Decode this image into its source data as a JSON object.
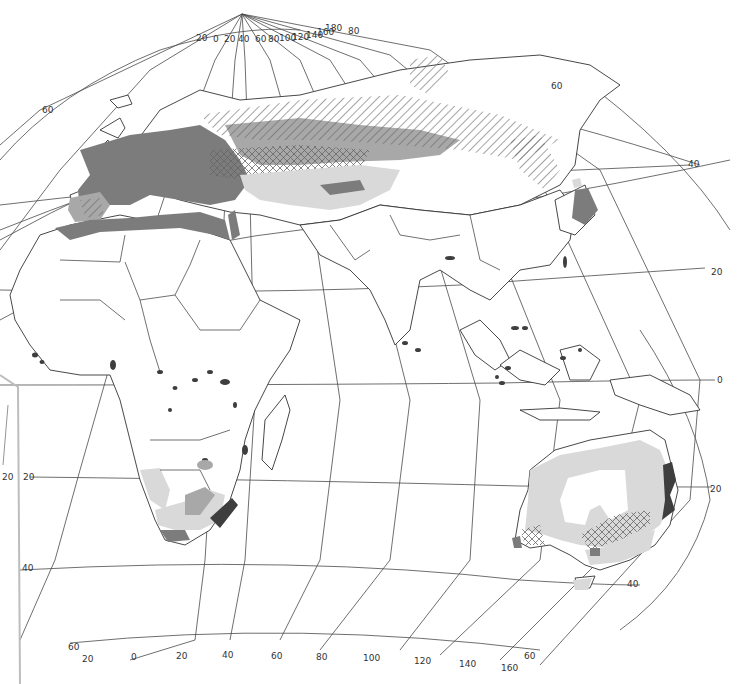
{
  "map": {
    "projection": "oblique",
    "region": "Eastern Hemisphere (Europe, Africa, Asia, Australia)",
    "meridian_labels_top": [
      "20",
      "0",
      "20",
      "40",
      "60",
      "80",
      "100",
      "120",
      "140",
      "160",
      "180"
    ],
    "top_right_parallel_label": "80",
    "meridian_labels_bottom": [
      "20",
      "0",
      "20",
      "40",
      "60",
      "80",
      "100",
      "120",
      "140",
      "160"
    ],
    "parallel_labels": {
      "left_60": "60",
      "right_60_north": "60",
      "right_40": "40",
      "right_20": "20",
      "right_0": "0",
      "right_20_south": "20",
      "left_20_south_a": "20",
      "left_20_south_b": "20",
      "left_40_south": "40",
      "right_40_south": "40",
      "bottom_left_60": "60",
      "bottom_right_60": "60"
    },
    "legend_shades": {
      "light": "#d9d9d9",
      "medium": "#a8a8a8",
      "dark": "#7c7c7c",
      "darkest": "#3e3e3e",
      "hatched": "diagonal-hatch",
      "cross_hatched": "cross-hatch"
    }
  }
}
